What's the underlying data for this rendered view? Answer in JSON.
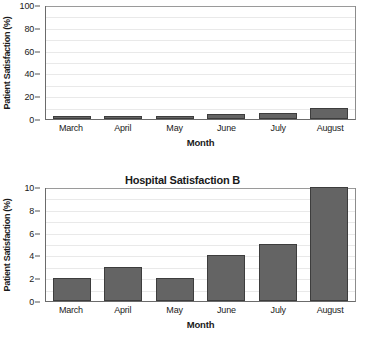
{
  "chart_data": [
    {
      "id": "chart-a",
      "type": "bar",
      "title": "",
      "xlabel": "Month",
      "ylabel": "Patient Satisfaction (%)",
      "categories": [
        "March",
        "April",
        "May",
        "June",
        "July",
        "August"
      ],
      "values": [
        2,
        3,
        2,
        4,
        5,
        10
      ],
      "ylim": [
        0,
        100
      ],
      "yticks": [
        0,
        20,
        40,
        60,
        80,
        100
      ],
      "ytick_labels": [
        "0",
        "20",
        "40",
        "60",
        "80",
        "100"
      ],
      "gridline_step": 10,
      "grid": true,
      "legend": "none",
      "bar_color": "#646464",
      "bar_edge_color": "#3d3d3d"
    },
    {
      "id": "chart-b",
      "type": "bar",
      "title": "Hospital Satisfaction B",
      "xlabel": "Month",
      "ylabel": "Patient Satisfaction (%)",
      "categories": [
        "March",
        "April",
        "May",
        "June",
        "July",
        "August"
      ],
      "values": [
        2,
        3,
        2,
        4,
        5,
        10
      ],
      "ylim": [
        0,
        10
      ],
      "yticks": [
        0,
        2,
        4,
        6,
        8,
        10
      ],
      "ytick_labels": [
        "0",
        "2",
        "4",
        "6",
        "8",
        "10"
      ],
      "gridline_step": 1,
      "grid": true,
      "legend": "none",
      "bar_color": "#646464",
      "bar_edge_color": "#3d3d3d"
    }
  ]
}
